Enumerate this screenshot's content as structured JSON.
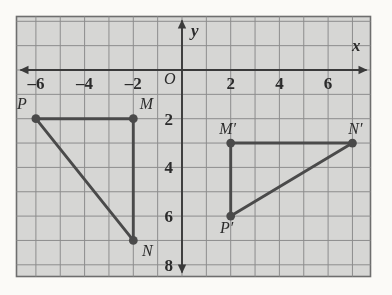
{
  "figure": {
    "kind": "coordinate-grid-geometry-figure",
    "background_color": "#fbfaf7",
    "grid_fill_color": "#d5d5d3",
    "grid_line_color": "#8d8d8d",
    "grid_border_color": "#6e6e6e",
    "axis_color": "#3a3a3a",
    "shape_color": "#4a4a4a",
    "label_color": "#2b2b2b"
  },
  "axes": {
    "x_axis_label": "x",
    "y_axis_label": "y",
    "origin_label": "O",
    "x_tick_labels": [
      "–6",
      "–4",
      "–2",
      "2",
      "4",
      "6"
    ],
    "x_tick_values": [
      -6,
      -4,
      -2,
      2,
      4,
      6
    ],
    "y_tick_labels": [
      "2",
      "4",
      "6",
      "8"
    ],
    "y_tick_values": [
      2,
      4,
      6,
      8
    ],
    "y_axis_direction": "downward-positive",
    "x_range": [
      -7,
      7.5
    ],
    "y_range": [
      -2,
      8.5
    ],
    "grid_step": 1
  },
  "chart_data": {
    "type": "scatter",
    "title": "",
    "xlabel": "x",
    "ylabel": "y",
    "xlim": [
      -7,
      7.5
    ],
    "ylim": [
      -2,
      8.5
    ],
    "grid": true,
    "legend": "none",
    "series": [
      {
        "name": "Triangle PMN",
        "closed": false,
        "points": [
          {
            "label": "P",
            "x": -6,
            "y": 2
          },
          {
            "label": "M",
            "x": -2,
            "y": 2
          },
          {
            "label": "N",
            "x": -2,
            "y": 7
          }
        ],
        "edges": [
          [
            "P",
            "M"
          ],
          [
            "M",
            "N"
          ],
          [
            "N",
            "P"
          ]
        ]
      },
      {
        "name": "Triangle P'M'N'",
        "closed": false,
        "points": [
          {
            "label": "M'",
            "x": 2,
            "y": 3
          },
          {
            "label": "N'",
            "x": 7,
            "y": 3
          },
          {
            "label": "P'",
            "x": 2,
            "y": 6
          }
        ],
        "edges": [
          [
            "M'",
            "N'"
          ],
          [
            "N'",
            "P'"
          ],
          [
            "P'",
            "M'"
          ]
        ]
      }
    ]
  },
  "point_labels": {
    "P": "P",
    "M": "M",
    "N": "N",
    "M_prime": "M′",
    "N_prime": "N′",
    "P_prime": "P′"
  }
}
